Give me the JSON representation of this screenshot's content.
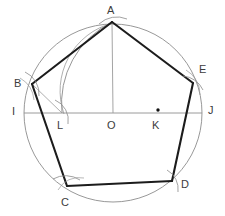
{
  "figure": {
    "canvas": {
      "width": 225,
      "height": 216
    },
    "colors": {
      "circle": "#8c8c8c",
      "arc": "#8a8a8a",
      "diameter": "#8f8f8f",
      "thin_line": "#9a9a9a",
      "pentagon": "#1c1c1c",
      "label": "#3c3c3c",
      "point_dot": "#111111",
      "background": "#ffffff"
    },
    "circle": {
      "center_label": "O",
      "cx": 113,
      "cy": 113,
      "r": 89
    },
    "pentagon": {
      "sides": 5,
      "vertex_labels": [
        "A",
        "B",
        "C",
        "D",
        "E"
      ],
      "vertices": [
        {
          "label": "A",
          "x": 112,
          "y": 22
        },
        {
          "label": "B",
          "x": 32,
          "y": 84
        },
        {
          "label": "C",
          "x": 67,
          "y": 186
        },
        {
          "label": "D",
          "x": 172,
          "y": 181
        },
        {
          "label": "E",
          "x": 193,
          "y": 83
        }
      ]
    },
    "points": [
      {
        "label": "A",
        "x": 112,
        "y": 22,
        "lx": 107,
        "ly": 5,
        "dot": false
      },
      {
        "label": "B",
        "x": 32,
        "y": 84,
        "lx": 14,
        "ly": 80,
        "dot": false
      },
      {
        "label": "C",
        "x": 67,
        "y": 186,
        "lx": 61,
        "ly": 199,
        "dot": false
      },
      {
        "label": "D",
        "x": 172,
        "y": 181,
        "lx": 181,
        "ly": 180,
        "dot": false
      },
      {
        "label": "E",
        "x": 193,
        "y": 83,
        "lx": 199,
        "ly": 66,
        "dot": false
      },
      {
        "label": "I",
        "x": 24,
        "y": 113,
        "lx": 12,
        "ly": 107,
        "dot": false
      },
      {
        "label": "J",
        "x": 202,
        "y": 113,
        "lx": 208,
        "ly": 106,
        "dot": false
      },
      {
        "label": "L",
        "x": 62,
        "y": 113,
        "lx": 58,
        "ly": 121,
        "dot": false
      },
      {
        "label": "O",
        "x": 113,
        "y": 113,
        "lx": 108,
        "ly": 121,
        "dot": false
      },
      {
        "label": "K",
        "x": 158,
        "y": 113,
        "lx": 153,
        "ly": 121,
        "dot": true
      }
    ],
    "segments": {
      "diameter": {
        "from": "I",
        "to": "J",
        "x1": 24,
        "y1": 113,
        "x2": 202,
        "y2": 113
      },
      "radius_OA": {
        "from": "O",
        "to": "A",
        "x1": 112,
        "y1": 22,
        "x2": 113,
        "y2": 113
      },
      "chord_BL": {
        "from": "B",
        "to": "L",
        "x1": 32,
        "y1": 84,
        "x2": 62,
        "y2": 113
      }
    },
    "construction_arcs": [
      {
        "name": "arc-A-to-L-centered-K",
        "description": "Arc centered at K with radius KA, meeting diameter at L"
      },
      {
        "name": "arc-at-A",
        "description": "Tick arcs crossing vertex A"
      },
      {
        "name": "arc-at-B",
        "description": "Tick arcs crossing vertex B"
      },
      {
        "name": "arc-at-C",
        "description": "Tick arcs crossing vertex C"
      },
      {
        "name": "arc-at-D",
        "description": "Tick arcs crossing vertex D"
      },
      {
        "name": "arc-at-E",
        "description": "Tick arcs crossing vertex E"
      },
      {
        "name": "arc-at-L",
        "description": "Tick arcs crossing point L"
      }
    ]
  }
}
